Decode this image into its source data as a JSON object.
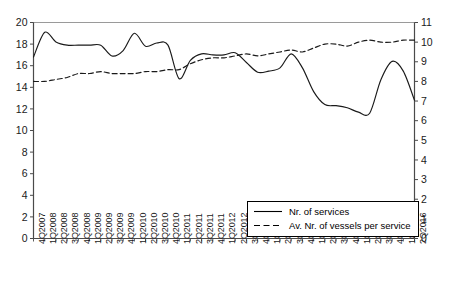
{
  "chart_data": {
    "type": "line",
    "title": "",
    "xlabel": "",
    "ylabel": "",
    "y2label": "",
    "ylim": [
      0,
      20
    ],
    "y2lim": [
      0,
      11
    ],
    "yticks": [
      0,
      2,
      4,
      6,
      8,
      10,
      12,
      14,
      16,
      18,
      20
    ],
    "y2ticks": [
      0,
      1,
      2,
      3,
      4,
      5,
      6,
      7,
      8,
      9,
      10,
      11
    ],
    "grid": false,
    "legend_position": "bottom-right",
    "categories": [
      "4Q2007",
      "1Q2008",
      "2Q2008",
      "3Q2008",
      "4Q2008",
      "1Q2009",
      "2Q2009",
      "3Q2009",
      "4Q2009",
      "1Q2010",
      "2Q2010",
      "3Q2010",
      "4Q2010",
      "1Q2011",
      "2Q2011",
      "3Q2011",
      "4Q2011",
      "1Q2012",
      "2Q2012",
      "3Q2012",
      "4Q2012",
      "1Q2013",
      "2Q2013",
      "3Q2013",
      "4Q2013",
      "1Q2014",
      "2Q2014",
      "3Q2014",
      "4Q2014",
      "1Q2015",
      "2Q2015",
      "3Q2015",
      "4Q2015",
      "1Q2016",
      "2Q2016"
    ],
    "series": [
      {
        "name": "Nr. of services",
        "axis": "left",
        "style": "solid",
        "color": "#1a1a1a",
        "values": [
          16.8,
          19.1,
          18.2,
          17.9,
          17.9,
          17.9,
          17.9,
          16.9,
          17.4,
          19.0,
          17.8,
          18.1,
          17.9,
          14.8,
          16.5,
          17.1,
          17.0,
          17.0,
          17.2,
          16.3,
          15.4,
          15.5,
          15.8,
          17.1,
          15.8,
          13.6,
          12.4,
          12.3,
          12.1,
          11.7,
          11.6,
          14.7,
          16.4,
          15.5,
          12.8
        ]
      },
      {
        "name": "Av. Nr. of vessels per service",
        "axis": "right",
        "style": "dashed",
        "color": "#1a1a1a",
        "values": [
          8.0,
          8.0,
          8.1,
          8.2,
          8.4,
          8.4,
          8.5,
          8.4,
          8.4,
          8.4,
          8.5,
          8.5,
          8.6,
          8.6,
          8.9,
          9.1,
          9.2,
          9.2,
          9.3,
          9.4,
          9.3,
          9.4,
          9.5,
          9.6,
          9.5,
          9.7,
          9.9,
          9.9,
          9.8,
          10.0,
          10.1,
          10.0,
          10.0,
          10.1,
          10.1
        ]
      }
    ],
    "legend": [
      {
        "label": "Nr. of services",
        "style": "solid"
      },
      {
        "label": "Av. Nr. of vessels per service",
        "style": "dashed"
      }
    ]
  }
}
